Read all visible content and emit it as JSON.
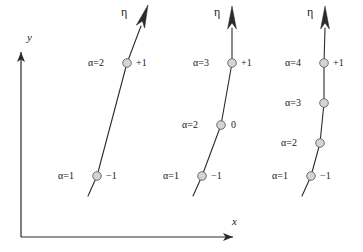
{
  "figure": {
    "background": "#ffffff",
    "stroke_color": "#2b2b2b",
    "node_fill": "#d4d4d4",
    "node_stroke": "#6e6e6e",
    "axes": {
      "x_label": "x",
      "y_label": "y",
      "origin": [
        21,
        237
      ],
      "x_end": [
        243,
        237
      ],
      "y_end": [
        21,
        42
      ],
      "x_label_pos": [
        232,
        216
      ],
      "y_label_pos": [
        27,
        32
      ]
    },
    "groups": [
      {
        "name": "group-1",
        "eta_label": "η",
        "eta_label_pos": [
          121,
          6
        ],
        "arrow_tip": [
          148,
          5
        ],
        "arrow_base": [
          140,
          28
        ],
        "path": [
          [
            88,
            196
          ],
          [
            97,
            176
          ],
          [
            127,
            63
          ],
          [
            141,
            26
          ]
        ],
        "nodes": [
          {
            "alpha": "α=2",
            "value": "+1",
            "cx": 127,
            "cy": 63,
            "alpha_pos": [
              88,
              58
            ],
            "value_pos": [
              136,
              58
            ]
          },
          {
            "alpha": "α=1",
            "value": "−1",
            "cx": 97,
            "cy": 176,
            "alpha_pos": [
              58,
              171
            ],
            "value_pos": [
              106,
              171
            ]
          }
        ]
      },
      {
        "name": "group-2",
        "eta_label": "η",
        "eta_label_pos": [
          214,
          6
        ],
        "arrow_tip": [
          232,
          6
        ],
        "arrow_base": [
          232,
          28
        ],
        "path": [
          [
            193,
            196
          ],
          [
            202,
            176
          ],
          [
            221,
            125
          ],
          [
            232,
            63
          ],
          [
            232,
            28
          ]
        ],
        "nodes": [
          {
            "alpha": "α=3",
            "value": "+1",
            "cx": 232,
            "cy": 63,
            "alpha_pos": [
              193,
              58
            ],
            "value_pos": [
              241,
              58
            ]
          },
          {
            "alpha": "α=2",
            "value": "0",
            "cx": 221,
            "cy": 125,
            "alpha_pos": [
              182,
              120
            ],
            "value_pos": [
              231,
              120
            ]
          },
          {
            "alpha": "α=1",
            "value": "−1",
            "cx": 202,
            "cy": 176,
            "alpha_pos": [
              163,
              171
            ],
            "value_pos": [
              211,
              171
            ]
          }
        ]
      },
      {
        "name": "group-3",
        "eta_label": "η",
        "eta_label_pos": [
          307,
          6
        ],
        "arrow_tip": [
          325,
          6
        ],
        "arrow_base": [
          325,
          28
        ],
        "path": [
          [
            302,
            196
          ],
          [
            311,
            176
          ],
          [
            320,
            143
          ],
          [
            324,
            103
          ],
          [
            324,
            63
          ],
          [
            325,
            28
          ]
        ],
        "nodes": [
          {
            "alpha": "α=4",
            "value": "+1",
            "cx": 324,
            "cy": 63,
            "alpha_pos": [
              285,
              58
            ],
            "value_pos": [
              333,
              58
            ]
          },
          {
            "alpha": "α=3",
            "value": "",
            "cx": 324,
            "cy": 103,
            "alpha_pos": [
              285,
              98
            ],
            "value_pos": [
              333,
              98
            ]
          },
          {
            "alpha": "α=2",
            "value": "",
            "cx": 320,
            "cy": 143,
            "alpha_pos": [
              281,
              138
            ],
            "value_pos": [
              329,
              138
            ]
          },
          {
            "alpha": "α=1",
            "value": "−1",
            "cx": 311,
            "cy": 176,
            "alpha_pos": [
              272,
              171
            ],
            "value_pos": [
              320,
              171
            ]
          }
        ]
      }
    ]
  }
}
